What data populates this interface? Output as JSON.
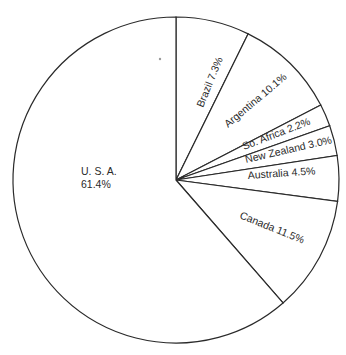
{
  "chart_data": {
    "type": "pie",
    "title": "",
    "start_angle_deg": 0,
    "direction": "clockwise",
    "categories": [
      "Brazil",
      "Argentina",
      "So. Africa",
      "New Zealand",
      "Australia",
      "Canada",
      "U.S.A."
    ],
    "values": [
      7.3,
      10.1,
      2.2,
      3.0,
      4.5,
      11.5,
      61.4
    ],
    "labels": [
      "Brazil 7.3%",
      "Argentina 10.1%",
      "So. Africa 2.2%",
      "New Zealand 3.0%",
      "Australia 4.5%",
      "Canada 11.5%",
      "U.S.A. 61.4%"
    ],
    "legend": "none",
    "fill_color": "#ffffff",
    "stroke_color": "#2a2a2a"
  },
  "labels": {
    "brazil": "Brazil  7.3%",
    "argentina": "Argentina  10.1%",
    "so_africa": "So. Africa  2.2%",
    "new_zealand": "New Zealand  3.0%",
    "australia": "Australia  4.5%",
    "canada": "Canada  11.5%",
    "usa_name": "U. S. A.",
    "usa_value": "61.4%"
  }
}
